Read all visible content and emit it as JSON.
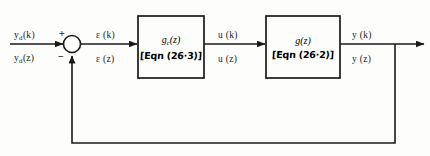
{
  "diagram": {
    "line_color": "#1a1a1a",
    "background_color": "#fdfdfb",
    "reference_input": {
      "label_discrete": "y",
      "label_discrete_sub": "d",
      "label_discrete_arg": "(k)",
      "label_z": "y",
      "label_z_sub": "d",
      "label_z_arg": "(z)"
    },
    "summing_junction": {
      "name": "summing-junction",
      "plus_sign": "+",
      "minus_sign": "−"
    },
    "error_signal": {
      "label_discrete": "ε (k)",
      "label_z": "ε (z)"
    },
    "controller_block": {
      "transfer_function": "g",
      "transfer_function_sub": "c",
      "transfer_function_arg": "(z)",
      "equation_ref": "[Eqn (26·3)]"
    },
    "control_signal": {
      "label_discrete": "u (k)",
      "label_z": "u (z)"
    },
    "plant_block": {
      "transfer_function": "g",
      "transfer_function_arg": "(z)",
      "equation_ref": "[Eqn (26·2)]"
    },
    "output_signal": {
      "label_discrete": "y (k)",
      "label_z": "y (z)"
    },
    "feedback_path": {
      "name": "feedback-path",
      "label": ""
    }
  }
}
